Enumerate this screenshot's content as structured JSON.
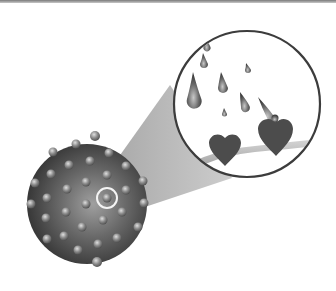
{
  "figure": {
    "colors": {
      "background": "#ffffff",
      "cell_dark": "#3a3a3a",
      "cell_light": "#9a9a9a",
      "receptor": "#8a8a8a",
      "highlight_ring": "#f2f2f2",
      "beam": "#b4b4b4",
      "inset_border": "#3c3c3c",
      "heart": "#4a4a4a",
      "droplet": "#555555",
      "membrane": "#a8a8a8"
    },
    "cell": {
      "cx": 87,
      "cy": 204,
      "r": 60
    },
    "highlighted_receptor": {
      "cx": 107,
      "cy": 198,
      "r": 10
    },
    "inset": {
      "cx": 247,
      "cy": 104,
      "r": 73
    },
    "droplets": [
      {
        "x": 207,
        "y": 40,
        "size": 5
      },
      {
        "x": 205,
        "y": 60,
        "size": 6
      },
      {
        "x": 198,
        "y": 95,
        "size": 11
      },
      {
        "x": 224,
        "y": 82,
        "size": 7
      },
      {
        "x": 248,
        "y": 68,
        "size": 4
      },
      {
        "x": 246,
        "y": 104,
        "size": 6
      },
      {
        "x": 225,
        "y": 114,
        "size": 4
      }
    ],
    "hearts": [
      {
        "x": 225,
        "y": 148,
        "size": 34
      },
      {
        "x": 275,
        "y": 130,
        "size": 36
      }
    ]
  }
}
